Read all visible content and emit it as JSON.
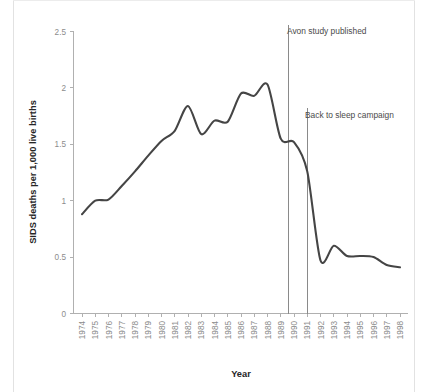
{
  "figure": {
    "background_color": "#ffffff",
    "border_color": "#e2e2e2",
    "line_color": "#454545",
    "axis_color": "#b0b0b0",
    "tick_text_color": "#8c8c8c",
    "title_text_color": "#262626",
    "annotation_text_color": "#4a4a4a",
    "event_line_color": "#8a8a8a"
  },
  "chart_data": {
    "type": "line",
    "title": "",
    "xlabel": "Year",
    "ylabel": "SIDS deaths per 1,000 live births",
    "xlim": [
      1974,
      1998
    ],
    "ylim": [
      0,
      2.5
    ],
    "grid": false,
    "legend": "none",
    "ytick_labels": [
      "0",
      "0.5",
      "1",
      "1.5",
      "2",
      "2.5"
    ],
    "ytick_values": [
      0,
      0.5,
      1,
      1.5,
      2,
      2.5
    ],
    "xtick_labels": [
      "1974",
      "1975",
      "1976",
      "1977",
      "1978",
      "1979",
      "1980",
      "1981",
      "1982",
      "1983",
      "1984",
      "1985",
      "1986",
      "1987",
      "1988",
      "1989",
      "1990",
      "1991",
      "1992",
      "1993",
      "1994",
      "1995",
      "1996",
      "1997",
      "1998"
    ],
    "x": [
      1974,
      1975,
      1976,
      1977,
      1978,
      1979,
      1980,
      1981,
      1982,
      1983,
      1984,
      1985,
      1986,
      1987,
      1988,
      1989,
      1990,
      1991,
      1992,
      1993,
      1994,
      1995,
      1996,
      1997,
      1998
    ],
    "values": [
      0.88,
      1.0,
      1.01,
      1.13,
      1.26,
      1.4,
      1.53,
      1.62,
      1.84,
      1.59,
      1.71,
      1.7,
      1.95,
      1.93,
      2.03,
      1.55,
      1.52,
      1.26,
      0.47,
      0.6,
      0.51,
      0.51,
      0.5,
      0.43,
      0.41
    ],
    "annotations": [
      {
        "label": "Avon study published",
        "x": 1989.6
      },
      {
        "label": "Back to sleep campaign",
        "x": 1991.0
      }
    ]
  }
}
